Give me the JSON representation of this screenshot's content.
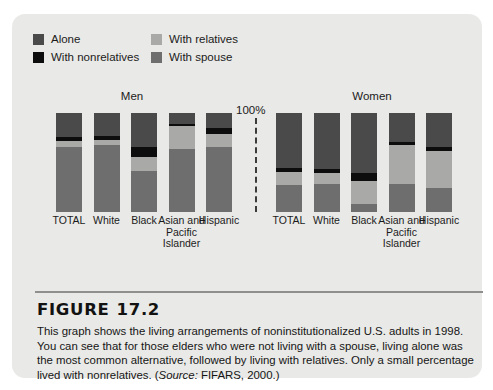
{
  "figure": {
    "number_label": "FIGURE",
    "number": "17.2",
    "caption_main": "This graph shows the living arrangements of noninstitutionalized U.S. adults in 1998. You can see that for those elders who were not living with a spouse, living alone was the most common alternative, followed by living with relatives. Only a small percentage lived with nonrelatives. (",
    "caption_source_label": "Source:",
    "caption_source": " FIFARS, 2000.)"
  },
  "legend": {
    "items": [
      {
        "label": "Alone",
        "color": "#4a4a4a",
        "icon": "color-swatch-icon"
      },
      {
        "label": "With relatives",
        "color": "#a9a9a7",
        "icon": "color-swatch-icon"
      },
      {
        "label": "With nonrelatives",
        "color": "#0d0d0d",
        "icon": "color-swatch-icon"
      },
      {
        "label": "With spouse",
        "color": "#6e6e6e",
        "icon": "color-swatch-icon"
      }
    ]
  },
  "axis": {
    "top_label": "100%"
  },
  "chart_data": {
    "type": "bar",
    "subtitle": "",
    "xlabel": "",
    "ylabel": "Percent",
    "ylim": [
      0,
      100
    ],
    "grid": false,
    "stacked": true,
    "stack_total": 100,
    "legend_position": "top-left",
    "panels": [
      {
        "name": "Men",
        "categories": [
          "TOTAL",
          "White",
          "Black",
          "Asian and Pacific Islander",
          "Hispanic"
        ],
        "series": [
          {
            "name": "Alone",
            "color": "#4a4a4a",
            "values": [
              24,
              23,
              34,
              11,
              15
            ]
          },
          {
            "name": "With nonrelatives",
            "color": "#0d0d0d",
            "values": [
              4,
              4,
              10,
              2,
              6
            ]
          },
          {
            "name": "With relatives",
            "color": "#a9a9a7",
            "values": [
              6,
              5,
              15,
              23,
              13
            ]
          },
          {
            "name": "With spouse",
            "color": "#6e6e6e",
            "values": [
              66,
              68,
              41,
              64,
              66
            ]
          }
        ]
      },
      {
        "name": "Women",
        "categories": [
          "TOTAL",
          "White",
          "Black",
          "Asian and Pacific Islander",
          "Hispanic"
        ],
        "series": [
          {
            "name": "Alone",
            "color": "#4a4a4a",
            "values": [
              56,
              57,
              61,
              29,
              34
            ]
          },
          {
            "name": "With nonrelatives",
            "color": "#0d0d0d",
            "values": [
              4,
              4,
              8,
              3,
              4
            ]
          },
          {
            "name": "With relatives",
            "color": "#a9a9a7",
            "values": [
              13,
              11,
              23,
              40,
              38
            ]
          },
          {
            "name": "With spouse",
            "color": "#6e6e6e",
            "values": [
              27,
              28,
              8,
              28,
              24
            ]
          }
        ]
      }
    ]
  }
}
